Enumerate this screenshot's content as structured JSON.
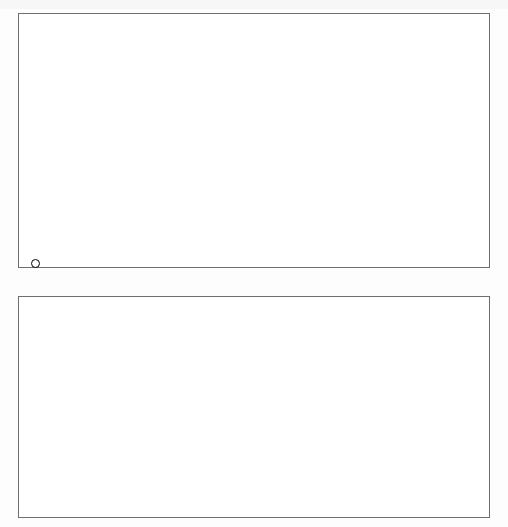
{
  "figure": {
    "orientation": "rotated-180",
    "legend": {
      "label": "Afrika südlich der Sahara",
      "marker": "open-circle"
    },
    "colors": {
      "bubble_fill": "#b4b4b4",
      "bubble_stroke": "#8a8a8a",
      "africa_stroke": "#000000",
      "gridline": "#4d4d4d",
      "zero_gridline": "#a8a8a8",
      "trendline": "#000000",
      "frame": "#6e6e6e"
    }
  },
  "chart_data": [
    {
      "id": "top",
      "type": "scatter",
      "title": "",
      "xlabel": "BIP pro Kopf, proportional zur Bevölkerung im Jahr 1980,\nzu Preisen von 1996, in Tausend US$",
      "ylabel": "Wachstum des realen BIP pro Kopf\n1980–2000, % p.a.",
      "xticks": [
        0,
        5,
        10,
        15,
        20,
        25
      ],
      "xlim": [
        0,
        26.5
      ],
      "yticks": [
        "4",
        "2",
        "-",
        "0",
        "+",
        "2",
        "4",
        "6"
      ],
      "ytick_values": [
        -4,
        -2,
        0,
        0,
        0,
        2,
        4,
        6
      ],
      "ylim": [
        -4,
        7
      ],
      "grid": true,
      "x_axis_direction": "right-to-left",
      "marker_size_encodes": "population-1980",
      "annotations": [
        {
          "label": "USA",
          "x": 24.6,
          "y": 2.0,
          "r": 17
        },
        {
          "label": "Indien",
          "x": 1.3,
          "y": 4.2,
          "r": 26
        },
        {
          "label": "China",
          "x": 1.1,
          "y": 5.9,
          "r": 34
        }
      ],
      "series": [
        {
          "name": "Welt (ohne Afrika südlich der Sahara)",
          "style": "gray-bubble",
          "points": [
            {
              "x": 1.1,
              "y": 5.9,
              "r": 34
            },
            {
              "x": 1.3,
              "y": 4.2,
              "r": 26
            },
            {
              "x": 24.6,
              "y": 2.0,
              "r": 17
            },
            {
              "x": 0.7,
              "y": 1.9,
              "r": 15
            },
            {
              "x": 8.0,
              "y": 0.6,
              "r": 16
            },
            {
              "x": 8.6,
              "y": 0.9,
              "r": 11
            },
            {
              "x": 2.1,
              "y": 2.7,
              "r": 9
            },
            {
              "x": 2.4,
              "y": 3.1,
              "r": 11
            },
            {
              "x": 2.9,
              "y": 2.9,
              "r": 8
            },
            {
              "x": 1.6,
              "y": 2.6,
              "r": 7
            },
            {
              "x": 3.4,
              "y": 2.5,
              "r": 7
            },
            {
              "x": 3.6,
              "y": 2.1,
              "r": 7
            },
            {
              "x": 4.0,
              "y": 1.6,
              "r": 6
            },
            {
              "x": 4.4,
              "y": 0.4,
              "r": 6
            },
            {
              "x": 4.9,
              "y": 0.1,
              "r": 5
            },
            {
              "x": 4.6,
              "y": -0.5,
              "r": 5
            },
            {
              "x": 5.3,
              "y": -0.4,
              "r": 4
            },
            {
              "x": 5.6,
              "y": 0.0,
              "r": 4
            },
            {
              "x": 6.1,
              "y": -0.7,
              "r": 4
            },
            {
              "x": 6.6,
              "y": -0.3,
              "r": 4
            },
            {
              "x": 3.1,
              "y": 3.3,
              "r": 6
            },
            {
              "x": 3.0,
              "y": 1.2,
              "r": 5
            },
            {
              "x": 2.6,
              "y": 1.3,
              "r": 5
            },
            {
              "x": 2.2,
              "y": 1.0,
              "r": 5
            },
            {
              "x": 1.9,
              "y": 0.1,
              "r": 5
            },
            {
              "x": 5.0,
              "y": 1.4,
              "r": 5
            },
            {
              "x": 6.9,
              "y": -1.1,
              "r": 3
            },
            {
              "x": 7.4,
              "y": -0.2,
              "r": 4
            },
            {
              "x": 7.1,
              "y": 0.2,
              "r": 3
            },
            {
              "x": 9.2,
              "y": -1.3,
              "r": 5
            },
            {
              "x": 9.6,
              "y": 1.6,
              "r": 4
            },
            {
              "x": 10.1,
              "y": 0.9,
              "r": 5
            },
            {
              "x": 11.0,
              "y": 1.5,
              "r": 5
            },
            {
              "x": 11.6,
              "y": 0.4,
              "r": 4
            },
            {
              "x": 12.4,
              "y": -0.1,
              "r": 6
            },
            {
              "x": 13.0,
              "y": 2.1,
              "r": 4
            },
            {
              "x": 13.6,
              "y": 2.0,
              "r": 7
            },
            {
              "x": 14.0,
              "y": 0.6,
              "r": 3
            },
            {
              "x": 14.9,
              "y": 0.9,
              "r": 5
            },
            {
              "x": 15.4,
              "y": -0.6,
              "r": 4
            },
            {
              "x": 16.3,
              "y": 3.6,
              "r": 3
            },
            {
              "x": 17.3,
              "y": 4.6,
              "r": 3
            },
            {
              "x": 18.2,
              "y": 2.9,
              "r": 3
            },
            {
              "x": 18.7,
              "y": 2.2,
              "r": 9
            },
            {
              "x": 19.4,
              "y": 2.2,
              "r": 8
            },
            {
              "x": 19.9,
              "y": 2.4,
              "r": 4
            },
            {
              "x": 20.2,
              "y": 1.9,
              "r": 5
            },
            {
              "x": 20.8,
              "y": 2.5,
              "r": 4
            },
            {
              "x": 21.3,
              "y": 2.0,
              "r": 4
            },
            {
              "x": 21.9,
              "y": 2.3,
              "r": 3
            },
            {
              "x": 22.5,
              "y": 2.1,
              "r": 6
            },
            {
              "x": 23.3,
              "y": 1.6,
              "r": 3
            },
            {
              "x": 25.6,
              "y": 0.9,
              "r": 4
            },
            {
              "x": 9.9,
              "y": 5.9,
              "r": 6
            },
            {
              "x": 7.9,
              "y": -1.0,
              "r": 3
            },
            {
              "x": 10.6,
              "y": -1.6,
              "r": 3
            },
            {
              "x": 2.0,
              "y": -0.9,
              "r": 3
            },
            {
              "x": 5.9,
              "y": 1.1,
              "r": 3
            },
            {
              "x": 3.8,
              "y": 0.0,
              "r": 3
            },
            {
              "x": 0.9,
              "y": 3.2,
              "r": 8
            },
            {
              "x": 1.5,
              "y": 2.2,
              "r": 6
            }
          ]
        },
        {
          "name": "Afrika südlich der Sahara",
          "style": "open-circle",
          "points": [
            {
              "x": 0.9,
              "y": -2.1,
              "r": 9
            },
            {
              "x": 1.0,
              "y": -1.5,
              "r": 5
            },
            {
              "x": 0.7,
              "y": -1.4,
              "r": 4
            },
            {
              "x": 1.1,
              "y": -1.6,
              "r": 5
            },
            {
              "x": 0.8,
              "y": -1.0,
              "r": 4
            },
            {
              "x": 0.6,
              "y": -0.7,
              "r": 4
            },
            {
              "x": 1.9,
              "y": -1.3,
              "r": 5
            },
            {
              "x": 2.6,
              "y": -1.0,
              "r": 4
            },
            {
              "x": 3.2,
              "y": -0.4,
              "r": 4
            },
            {
              "x": 0.5,
              "y": 0.1,
              "r": 6
            },
            {
              "x": 0.9,
              "y": 0.0,
              "r": 5
            },
            {
              "x": 1.2,
              "y": 0.2,
              "r": 4
            },
            {
              "x": 0.7,
              "y": 0.5,
              "r": 4
            },
            {
              "x": 1.0,
              "y": 0.7,
              "r": 3
            },
            {
              "x": 1.4,
              "y": 0.4,
              "r": 3
            },
            {
              "x": 0.6,
              "y": 1.1,
              "r": 3
            },
            {
              "x": 0.9,
              "y": 1.3,
              "r": 3
            },
            {
              "x": 8.0,
              "y": -0.6,
              "r": 9
            },
            {
              "x": 1.5,
              "y": 3.9,
              "r": 5
            },
            {
              "x": 2.1,
              "y": -0.1,
              "r": 4
            },
            {
              "x": 0.4,
              "y": -2.4,
              "r": 4
            }
          ]
        }
      ]
    },
    {
      "id": "bottom",
      "type": "scatter",
      "title": "",
      "xlabel": "BIP pro Kopf, 1980, in Tausend US$ zu Preisen von 1996",
      "ylabel": "Wachstum des realen BIP pro Kopf\n1980–2000, % p.a.",
      "xticks": [
        0,
        5,
        10,
        15,
        20,
        25
      ],
      "xlim": [
        0,
        26.5
      ],
      "yticks": [
        "4",
        "2",
        "-",
        "0",
        "+",
        "2",
        "4",
        "6"
      ],
      "ylim": [
        -4,
        7
      ],
      "grid": true,
      "x_axis_direction": "right-to-left",
      "marker_size_encodes": "none",
      "trendline": {
        "x0": 25.8,
        "y0": 2.0,
        "x1": 0.3,
        "y1": 0.45
      },
      "series": [
        {
          "name": "Welt (ohne Afrika südlich der Sahara)",
          "style": "gray-dot",
          "points": [
            {
              "x": 25.6,
              "y": 0.5
            },
            {
              "x": 24.4,
              "y": 1.9
            },
            {
              "x": 22.7,
              "y": 1.6
            },
            {
              "x": 21.6,
              "y": 1.5
            },
            {
              "x": 20.7,
              "y": 1.6
            },
            {
              "x": 20.0,
              "y": 1.8
            },
            {
              "x": 19.6,
              "y": 1.4
            },
            {
              "x": 19.0,
              "y": 1.5
            },
            {
              "x": 18.4,
              "y": 1.6
            },
            {
              "x": 17.9,
              "y": 1.9
            },
            {
              "x": 17.4,
              "y": 1.8
            },
            {
              "x": 16.9,
              "y": 1.7
            },
            {
              "x": 16.3,
              "y": 1.3
            },
            {
              "x": 15.5,
              "y": 1.9
            },
            {
              "x": 14.9,
              "y": 3.1
            },
            {
              "x": 14.1,
              "y": 3.9
            },
            {
              "x": 13.4,
              "y": 1.9
            },
            {
              "x": 13.1,
              "y": 1.1
            },
            {
              "x": 12.4,
              "y": 0.3
            },
            {
              "x": 11.9,
              "y": 0.8
            },
            {
              "x": 11.2,
              "y": 0.1
            },
            {
              "x": 10.6,
              "y": -1.6
            },
            {
              "x": 10.3,
              "y": 0.7
            },
            {
              "x": 10.1,
              "y": 1.1
            },
            {
              "x": 9.9,
              "y": 2.5
            },
            {
              "x": 9.3,
              "y": -2.0
            },
            {
              "x": 9.0,
              "y": 0.9
            },
            {
              "x": 8.6,
              "y": 0.4
            },
            {
              "x": 8.2,
              "y": 0.0
            },
            {
              "x": 7.9,
              "y": -0.4
            },
            {
              "x": 7.6,
              "y": 0.7
            },
            {
              "x": 7.2,
              "y": -0.6
            },
            {
              "x": 7.0,
              "y": 1.0
            },
            {
              "x": 6.7,
              "y": 1.5
            },
            {
              "x": 6.4,
              "y": 2.1
            },
            {
              "x": 6.1,
              "y": -0.3
            },
            {
              "x": 5.9,
              "y": -2.9
            },
            {
              "x": 5.7,
              "y": -3.2
            },
            {
              "x": 5.5,
              "y": 0.2
            },
            {
              "x": 5.3,
              "y": 0.5
            },
            {
              "x": 5.1,
              "y": -0.2
            },
            {
              "x": 4.9,
              "y": 1.2
            },
            {
              "x": 4.7,
              "y": -1.4
            },
            {
              "x": 4.5,
              "y": -1.8
            },
            {
              "x": 4.3,
              "y": -5.2
            },
            {
              "x": 4.1,
              "y": 0.1
            },
            {
              "x": 3.9,
              "y": 0.6
            },
            {
              "x": 3.7,
              "y": 1.0
            },
            {
              "x": 3.5,
              "y": -0.1
            },
            {
              "x": 3.3,
              "y": -0.5
            },
            {
              "x": 3.1,
              "y": -2.6
            },
            {
              "x": 2.9,
              "y": -2.3
            },
            {
              "x": 2.7,
              "y": 1.3
            },
            {
              "x": 2.5,
              "y": -0.3
            },
            {
              "x": 2.3,
              "y": 0.4
            },
            {
              "x": 2.1,
              "y": -3.8
            },
            {
              "x": 1.9,
              "y": -2.7
            },
            {
              "x": 1.7,
              "y": -3.1
            },
            {
              "x": 1.5,
              "y": -5.4
            },
            {
              "x": 1.4,
              "y": -0.2
            },
            {
              "x": 1.2,
              "y": 0.3
            },
            {
              "x": 1.0,
              "y": -0.6
            },
            {
              "x": 0.9,
              "y": 1.4
            },
            {
              "x": 0.8,
              "y": 2.0
            },
            {
              "x": 0.7,
              "y": 2.6
            },
            {
              "x": 0.6,
              "y": 1.0
            },
            {
              "x": 0.5,
              "y": 0.2
            },
            {
              "x": 1.1,
              "y": 3.0
            },
            {
              "x": 6.0,
              "y": 3.0
            },
            {
              "x": 12.6,
              "y": 1.2
            }
          ]
        },
        {
          "name": "Afrika südlich der Sahara",
          "style": "open-circle",
          "points": [
            {
              "x": 0.9,
              "y": 2.9
            },
            {
              "x": 1.1,
              "y": 2.6
            },
            {
              "x": 0.7,
              "y": 2.4
            },
            {
              "x": 1.0,
              "y": 2.2
            },
            {
              "x": 0.6,
              "y": 1.9
            },
            {
              "x": 0.8,
              "y": 1.6
            },
            {
              "x": 1.2,
              "y": 1.7
            },
            {
              "x": 0.5,
              "y": 1.3
            },
            {
              "x": 1.4,
              "y": 1.9
            },
            {
              "x": 0.9,
              "y": 0.8
            },
            {
              "x": 1.1,
              "y": 0.5
            },
            {
              "x": 0.7,
              "y": 0.3
            },
            {
              "x": 1.3,
              "y": 0.1
            },
            {
              "x": 0.6,
              "y": -0.1
            },
            {
              "x": 1.0,
              "y": -0.3
            },
            {
              "x": 0.8,
              "y": -0.6
            },
            {
              "x": 1.5,
              "y": 0.6
            },
            {
              "x": 2.0,
              "y": 0.4
            },
            {
              "x": 2.4,
              "y": 0.2
            },
            {
              "x": 2.2,
              "y": 0.9
            },
            {
              "x": 3.0,
              "y": 0.6
            },
            {
              "x": 9.7,
              "y": 0.5
            },
            {
              "x": 8.2,
              "y": -3.9
            },
            {
              "x": 0.6,
              "y": -3.9
            },
            {
              "x": 1.6,
              "y": 2.1
            }
          ]
        }
      ]
    }
  ]
}
